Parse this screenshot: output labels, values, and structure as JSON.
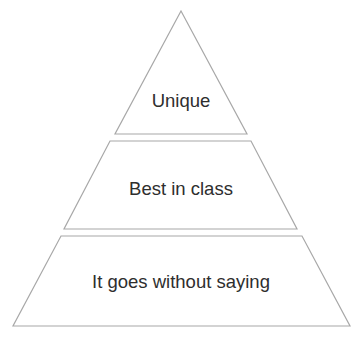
{
  "diagram": {
    "type": "pyramid",
    "stroke_color": "#a8a8a8",
    "text_color": "#2e2e2e",
    "tiers": [
      {
        "label": "Unique",
        "level": "top"
      },
      {
        "label": "Best in class",
        "level": "middle"
      },
      {
        "label": "It goes without saying",
        "level": "bottom"
      }
    ]
  }
}
